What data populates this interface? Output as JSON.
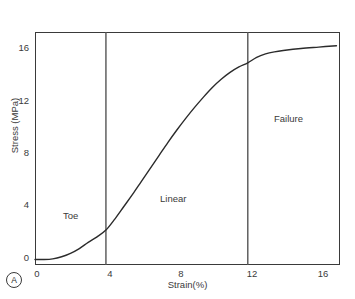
{
  "figure": {
    "panel_letter": "A"
  },
  "chart_data": {
    "type": "line",
    "title": "",
    "subtitle": "",
    "xlabel": "Strain(%)",
    "ylabel": "Stress (MPa)",
    "xlim": [
      0,
      17.2
    ],
    "ylim": [
      0,
      17.0
    ],
    "xticks": [
      0,
      4,
      8,
      12,
      16
    ],
    "xticklabels": [
      "0",
      "4",
      "8",
      "12",
      "16"
    ],
    "yticks": [
      0,
      4,
      8,
      12,
      16
    ],
    "yticklabels": [
      "0",
      "4",
      "8",
      "12",
      "16"
    ],
    "grid": false,
    "legend": "none",
    "line_color": "#2b2b2b",
    "series": [
      {
        "name": "Stress-strain curve",
        "x": [
          0.0,
          0.5,
          1.0,
          1.5,
          2.0,
          2.5,
          3.0,
          3.5,
          4.0,
          4.5,
          5.0,
          5.5,
          6.0,
          6.5,
          7.0,
          7.5,
          8.0,
          8.5,
          9.0,
          9.5,
          10.0,
          10.5,
          11.0,
          11.5,
          12.0,
          12.5,
          13.0,
          13.5,
          14.0,
          15.0,
          16.0,
          17.0
        ],
        "y": [
          0.4,
          0.4,
          0.45,
          0.6,
          0.85,
          1.2,
          1.65,
          2.05,
          2.55,
          3.35,
          4.25,
          5.15,
          6.1,
          7.05,
          8.0,
          8.95,
          9.85,
          10.7,
          11.5,
          12.25,
          12.95,
          13.55,
          14.05,
          14.45,
          14.75,
          15.15,
          15.4,
          15.55,
          15.65,
          15.8,
          15.9,
          16.0
        ]
      }
    ],
    "region_dividers": [
      {
        "x": 4,
        "label": "divider-toe-linear"
      },
      {
        "x": 12,
        "label": "divider-linear-failure"
      }
    ],
    "annotations": [
      {
        "text": "Toe",
        "x": 2.1,
        "y": 3.8
      },
      {
        "text": "Linear",
        "x": 7.9,
        "y": 5.1
      },
      {
        "text": "Failure",
        "x": 14.1,
        "y": 11.3
      }
    ]
  }
}
